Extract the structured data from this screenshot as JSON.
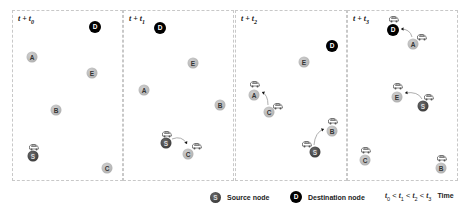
{
  "panels": [
    {
      "id": "t0",
      "label_prefix": "t + t",
      "label_sub": "0",
      "left": 12,
      "width": 111,
      "nodes": [
        {
          "id": "D",
          "type": "dest",
          "x": 95,
          "y": 27
        },
        {
          "id": "A",
          "type": "normal",
          "x": 32,
          "y": 57
        },
        {
          "id": "E",
          "type": "normal",
          "x": 92,
          "y": 73
        },
        {
          "id": "B",
          "type": "normal",
          "x": 56,
          "y": 110
        },
        {
          "id": "S",
          "type": "source",
          "x": 33,
          "y": 156
        },
        {
          "id": "C",
          "type": "normal",
          "x": 107,
          "y": 168
        }
      ],
      "packets": [
        {
          "x": 34,
          "y": 146
        }
      ],
      "arrows": []
    },
    {
      "id": "t1",
      "label_prefix": "t + t",
      "label_sub": "1",
      "left": 123,
      "width": 111,
      "nodes": [
        {
          "id": "D",
          "type": "dest",
          "x": 160,
          "y": 28
        },
        {
          "id": "E",
          "type": "normal",
          "x": 193,
          "y": 63
        },
        {
          "id": "A",
          "type": "normal",
          "x": 144,
          "y": 90
        },
        {
          "id": "B",
          "type": "normal",
          "x": 220,
          "y": 105
        },
        {
          "id": "S",
          "type": "source",
          "x": 166,
          "y": 143
        },
        {
          "id": "C",
          "type": "normal",
          "x": 188,
          "y": 154
        }
      ],
      "packets": [
        {
          "x": 167,
          "y": 133
        },
        {
          "x": 197,
          "y": 145
        }
      ],
      "arrows": [
        {
          "from": "S",
          "to": "C",
          "x1": 172,
          "y1": 139,
          "cx": 182,
          "cy": 135,
          "x2": 187,
          "y2": 144
        }
      ]
    },
    {
      "id": "t2",
      "label_prefix": "t + t",
      "label_sub": "2",
      "left": 235,
      "width": 112,
      "nodes": [
        {
          "id": "D",
          "type": "dest",
          "x": 332,
          "y": 46
        },
        {
          "id": "E",
          "type": "normal",
          "x": 304,
          "y": 62
        },
        {
          "id": "A",
          "type": "normal",
          "x": 254,
          "y": 95
        },
        {
          "id": "C",
          "type": "normal",
          "x": 269,
          "y": 112
        },
        {
          "id": "B",
          "type": "normal",
          "x": 332,
          "y": 131
        },
        {
          "id": "S",
          "type": "source",
          "x": 315,
          "y": 152
        }
      ],
      "packets": [
        {
          "x": 255,
          "y": 83
        },
        {
          "x": 278,
          "y": 105
        },
        {
          "x": 333,
          "y": 120
        },
        {
          "x": 307,
          "y": 143
        }
      ],
      "arrows": [
        {
          "from": "C",
          "to": "A",
          "x1": 268,
          "y1": 105,
          "cx": 268,
          "cy": 95,
          "x2": 262,
          "y2": 92
        },
        {
          "from": "S",
          "to": "B",
          "x1": 314,
          "y1": 145,
          "cx": 315,
          "cy": 132,
          "x2": 324,
          "y2": 129
        }
      ]
    },
    {
      "id": "t3",
      "label_prefix": "t + t",
      "label_sub": "3",
      "left": 347,
      "width": 111,
      "nodes": [
        {
          "id": "D",
          "type": "dest",
          "x": 393,
          "y": 30
        },
        {
          "id": "A",
          "type": "normal",
          "x": 413,
          "y": 44
        },
        {
          "id": "E",
          "type": "normal",
          "x": 397,
          "y": 97
        },
        {
          "id": "S",
          "type": "source",
          "x": 423,
          "y": 106
        },
        {
          "id": "C",
          "type": "normal",
          "x": 365,
          "y": 160
        },
        {
          "id": "B",
          "type": "normal",
          "x": 441,
          "y": 168
        }
      ],
      "packets": [
        {
          "x": 394,
          "y": 18
        },
        {
          "x": 422,
          "y": 36
        },
        {
          "x": 398,
          "y": 85
        },
        {
          "x": 429,
          "y": 96
        },
        {
          "x": 366,
          "y": 149
        },
        {
          "x": 442,
          "y": 157
        }
      ],
      "arrows": [
        {
          "from": "A",
          "to": "D",
          "x1": 412,
          "y1": 37,
          "cx": 410,
          "cy": 29,
          "x2": 401,
          "y2": 29
        },
        {
          "from": "S",
          "to": "E",
          "x1": 422,
          "y1": 99,
          "cx": 418,
          "cy": 91,
          "x2": 405,
          "y2": 93
        }
      ]
    }
  ],
  "legend": {
    "source": {
      "symbol": "S",
      "label": "Source node"
    },
    "destination": {
      "symbol": "D",
      "label": "Destination node"
    },
    "time": {
      "t0": "0",
      "t1": "1",
      "t2": "2",
      "t3": "3",
      "label": "Time"
    }
  },
  "colors": {
    "normal_node": "#b0b0b0",
    "source_node": "#3a3a3a",
    "dest_node": "#000000",
    "panel_border": "#c8c8c8"
  }
}
